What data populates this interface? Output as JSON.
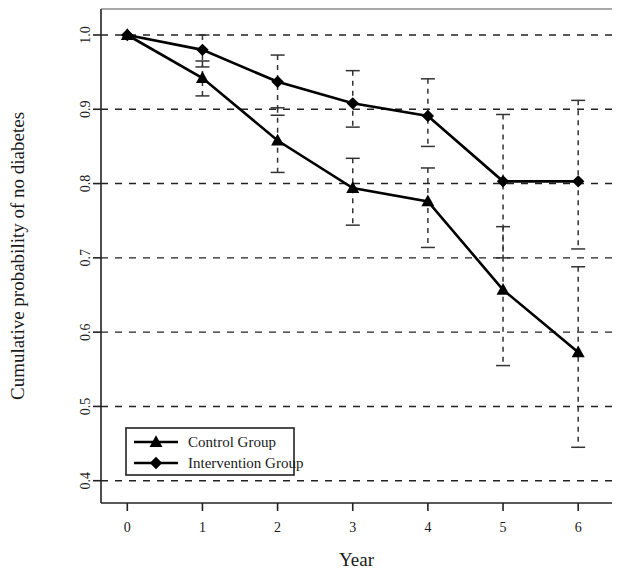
{
  "chart_data": {
    "type": "line",
    "title": "",
    "xlabel": "Year",
    "ylabel": "Cumulative probability of no diabetes",
    "x": [
      0,
      1,
      2,
      3,
      4,
      5,
      6
    ],
    "xticklabels": [
      "0",
      "1",
      "2",
      "3",
      "4",
      "5",
      "6"
    ],
    "yticklabels": [
      "0.4",
      "0.5",
      "0.6",
      "0.7",
      "0.8",
      "0.9",
      "1.0"
    ],
    "yticks": [
      0.4,
      0.5,
      0.6,
      0.7,
      0.8,
      0.9,
      1.0
    ],
    "xlim": [
      -0.35,
      6.45
    ],
    "ylim": [
      0.37,
      1.035
    ],
    "grid": "horizontal-dashed",
    "legend_position": "bottom-left",
    "series": [
      {
        "name": "Control Group",
        "marker": "triangle",
        "color": "#000000",
        "values": [
          1.0,
          0.942,
          0.858,
          0.794,
          0.776,
          0.657,
          0.573
        ],
        "err_upper": [
          1.0,
          0.965,
          0.902,
          0.834,
          0.821,
          0.742,
          0.688
        ],
        "err_lower": [
          1.0,
          0.918,
          0.815,
          0.744,
          0.714,
          0.555,
          0.445
        ]
      },
      {
        "name": "Intervention Group",
        "marker": "diamond",
        "color": "#000000",
        "values": [
          1.0,
          0.98,
          0.937,
          0.908,
          0.891,
          0.803,
          0.803
        ],
        "err_upper": [
          1.0,
          1.0,
          0.973,
          0.952,
          0.941,
          0.893,
          0.912
        ],
        "err_lower": [
          1.0,
          0.957,
          0.892,
          0.876,
          0.85,
          0.7,
          0.712
        ]
      }
    ]
  },
  "legend": {
    "items": [
      {
        "label": "Control Group",
        "marker": "triangle"
      },
      {
        "label": "Intervention Group",
        "marker": "diamond"
      }
    ]
  },
  "axes": {
    "x_title": "Year",
    "y_title": "Cumulative probability of no diabetes"
  }
}
